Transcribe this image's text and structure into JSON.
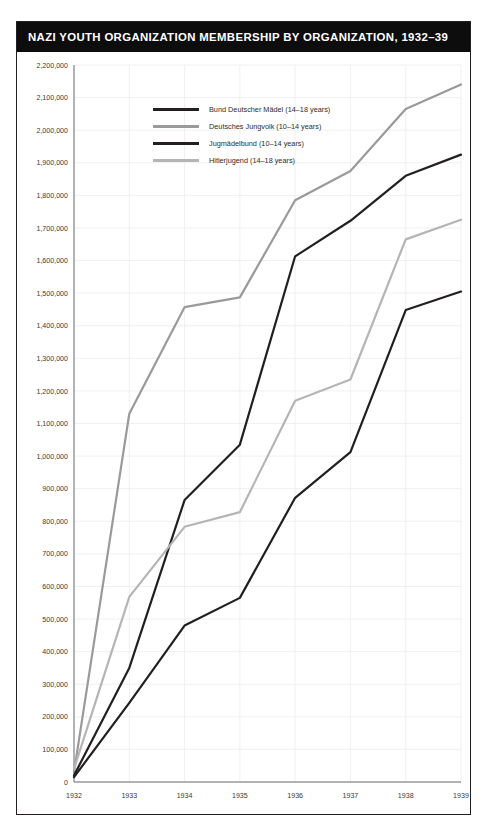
{
  "chart_title": "NAZI YOUTH ORGANIZATION MEMBERSHIP BY ORGANIZATION, 1932–39",
  "colors": {
    "title_bar_background": "#0d0d0d",
    "title_text": "#ffffff",
    "frame_border": "#231f20",
    "plot_background": "#ffffff",
    "gridline": "#ececec",
    "axis": "#6f6f6f",
    "axis_text": "#3b3b3b",
    "series_bdm": "#231f20",
    "series_dj": "#9a9a9a",
    "series_jm": "#231f20",
    "series_hj": "#b5b5b5"
  },
  "legend": {
    "position": "inside-top-left",
    "items": [
      {
        "label": "Bund Deutscher Mädel (14–18 years)",
        "color": "#231f20"
      },
      {
        "label": "Deutsches Jungvolk (10–14 years)",
        "color": "#9a9a9a"
      },
      {
        "label": "Jugmädelbund (10–14 years)",
        "color": "#231f20"
      },
      {
        "label": "Hitlerjugend (14–18 years)",
        "color": "#b5b5b5"
      }
    ]
  },
  "chart_data": {
    "type": "line",
    "title": "NAZI YOUTH ORGANIZATION MEMBERSHIP BY ORGANIZATION, 1932–39",
    "xlabel": "",
    "ylabel": "",
    "x": [
      1932,
      1933,
      1934,
      1935,
      1936,
      1937,
      1938,
      1939
    ],
    "categories": [
      "1932",
      "1933",
      "1934",
      "1935",
      "1936",
      "1937",
      "1938",
      "1939"
    ],
    "xlim": [
      1932,
      1939
    ],
    "ylim": [
      0,
      2200000
    ],
    "ytick_step": 100000,
    "grid": true,
    "ytick_labels": [
      "0",
      "100,000",
      "200,000",
      "300,000",
      "400,000",
      "500,000",
      "600,000",
      "700,000",
      "800,000",
      "900,000",
      "1,000,000",
      "1,100,000",
      "1,200,000",
      "1,300,000",
      "1,400,000",
      "1,500,000",
      "1,600,000",
      "1,700,000",
      "1,800,000",
      "1,900,000",
      "2,000,000",
      "2,100,000",
      "2,200,000"
    ],
    "series": [
      {
        "name": "Bund Deutscher Mädel (14–18 years)",
        "color": "#231f20",
        "values": [
          15000,
          243000,
          480000,
          565000,
          872000,
          1012000,
          1448000,
          1505000
        ]
      },
      {
        "name": "Deutsches Jungvolk (10–14 years)",
        "color": "#9a9a9a",
        "values": [
          30000,
          1130000,
          1457000,
          1487000,
          1785000,
          1875000,
          2065000,
          2140000
        ]
      },
      {
        "name": "Jugmädelbund (10–14 years)",
        "color": "#231f20",
        "values": [
          20000,
          350000,
          865000,
          1035000,
          1613000,
          1722000,
          1860000,
          1925000
        ]
      },
      {
        "name": "Hitlerjugend (14–18 years)",
        "color": "#b5b5b5",
        "values": [
          40000,
          568000,
          783000,
          828000,
          1170000,
          1235000,
          1665000,
          1725000
        ]
      }
    ]
  }
}
